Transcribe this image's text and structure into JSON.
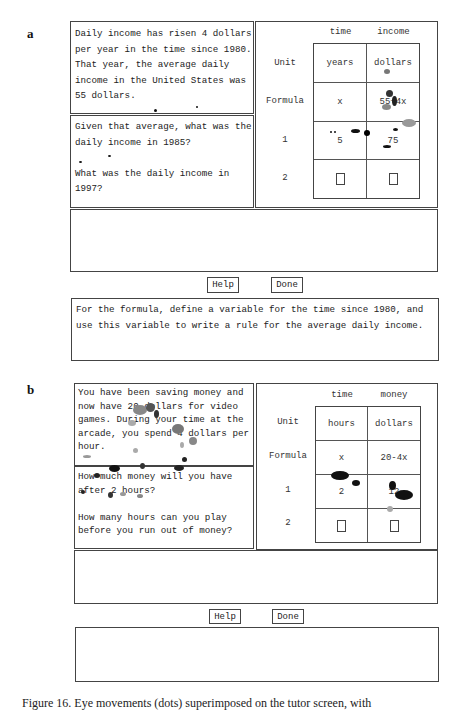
{
  "panels": [
    {
      "label": "a",
      "problem_text": "Daily income has risen 4 dollars\nper year in the time since 1980.\nThat year, the average daily\nincome in the United States was\n55 dollars.",
      "questions_text": "Given that average, what was the\ndaily income in 1985?\n\nWhat was the daily income in\n1997?",
      "table": {
        "columns": [
          "time",
          "income"
        ],
        "row_labels": [
          "Unit",
          "Formula",
          "1",
          "2"
        ],
        "cells": [
          [
            "years",
            "dollars"
          ],
          [
            "x",
            "55+4x"
          ],
          [
            "5",
            "75"
          ],
          [
            "",
            ""
          ]
        ]
      },
      "workspace_text": "",
      "buttons": {
        "help": "Help",
        "done": "Done"
      },
      "hint_text": "For the formula, define a variable for the time since 1980, and\nuse this variable to write a rule for the average daily income."
    },
    {
      "label": "b",
      "problem_text": "You have been saving money and\nnow have 20 dollars for video\ngames. During your time at the\narcade, you spend 4 dollars per\nhour.",
      "questions_text": "How much money will you have\nafter 2 hours?\n\nHow many hours can you play\nbefore you run out of money?",
      "table": {
        "columns": [
          "time",
          "money"
        ],
        "row_labels": [
          "Unit",
          "Formula",
          "1",
          "2"
        ],
        "cells": [
          [
            "hours",
            "dollars"
          ],
          [
            "x",
            "20-4x"
          ],
          [
            "2",
            "12"
          ],
          [
            "",
            ""
          ]
        ]
      },
      "workspace_text": "",
      "buttons": {
        "help": "Help",
        "done": "Done"
      },
      "hint_text": ""
    }
  ],
  "caption": "Figure 16.  Eye movements (dots) superimposed on the tutor screen, with"
}
